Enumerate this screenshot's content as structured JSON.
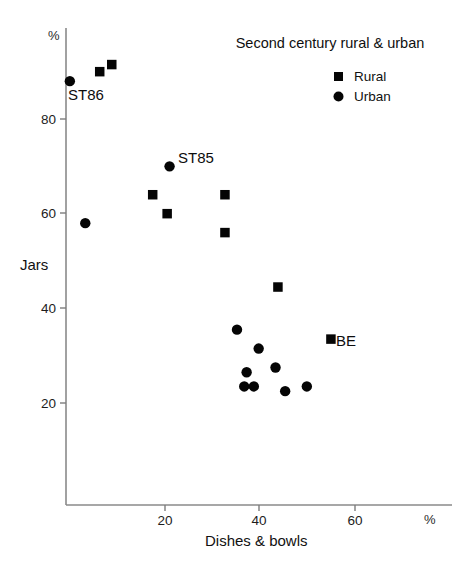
{
  "chart_data": {
    "type": "scatter",
    "title": "Second century rural & urban",
    "xlabel": "Dishes & bowls",
    "ylabel": "Jars",
    "x_unit": "%",
    "y_unit": "%",
    "xlim": [
      0,
      80
    ],
    "ylim": [
      14,
      96
    ],
    "xticks": [
      20,
      40,
      60
    ],
    "yticks": [
      20,
      40,
      60,
      80
    ],
    "grid": false,
    "legend_position": "top-right",
    "series": [
      {
        "name": "Rural",
        "marker": "square",
        "color": "#050505",
        "points": [
          {
            "x": 7.0,
            "y": 90.0,
            "label": ""
          },
          {
            "x": 9.5,
            "y": 91.5,
            "label": ""
          },
          {
            "x": 18.0,
            "y": 64.0,
            "label": ""
          },
          {
            "x": 21.0,
            "y": 60.0,
            "label": ""
          },
          {
            "x": 33.0,
            "y": 64.0,
            "label": ""
          },
          {
            "x": 33.0,
            "y": 56.0,
            "label": ""
          },
          {
            "x": 44.0,
            "y": 44.5,
            "label": ""
          },
          {
            "x": 55.0,
            "y": 33.5,
            "label": "BE"
          }
        ]
      },
      {
        "name": "Urban",
        "marker": "circle",
        "color": "#050505",
        "points": [
          {
            "x": 0.8,
            "y": 88.0,
            "label": "ST86"
          },
          {
            "x": 4.0,
            "y": 58.0,
            "label": ""
          },
          {
            "x": 21.5,
            "y": 70.0,
            "label": "ST85"
          },
          {
            "x": 35.5,
            "y": 35.5,
            "label": ""
          },
          {
            "x": 40.0,
            "y": 31.5,
            "label": ""
          },
          {
            "x": 37.5,
            "y": 26.5,
            "label": ""
          },
          {
            "x": 43.5,
            "y": 27.5,
            "label": ""
          },
          {
            "x": 37.0,
            "y": 23.5,
            "label": ""
          },
          {
            "x": 39.0,
            "y": 23.5,
            "label": ""
          },
          {
            "x": 45.5,
            "y": 22.5,
            "label": ""
          },
          {
            "x": 50.0,
            "y": 23.5,
            "label": ""
          }
        ]
      }
    ]
  },
  "labels": {
    "y_axis_pct": "%",
    "x_axis_pct": "%",
    "tick_20": "20",
    "tick_40": "40",
    "tick_60": "60",
    "tick_80": "80",
    "ytick_20": "20",
    "ytick_40": "40",
    "ytick_60": "60",
    "ytick_80": "80",
    "legend_rural": "Rural",
    "legend_urban": "Urban",
    "annot_st86": "ST86",
    "annot_st85": "ST85",
    "annot_be": "BE"
  }
}
